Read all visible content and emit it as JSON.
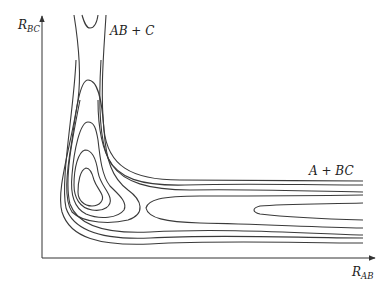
{
  "figure": {
    "type": "potential-energy-surface-contour",
    "axes": {
      "x": {
        "label": "R",
        "subscript": "AB"
      },
      "y": {
        "label": "R",
        "subscript": "BC"
      }
    },
    "annotations": {
      "products_channel": "AB + C",
      "reactants_channel": "A + BC"
    },
    "colors": {
      "line": "#3a3a3a",
      "background": "#ffffff"
    }
  }
}
